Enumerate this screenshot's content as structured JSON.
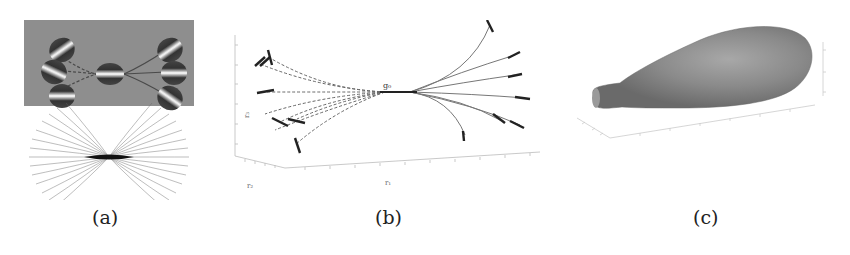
{
  "figure": {
    "panels": [
      {
        "id": "a",
        "caption": "(a)",
        "description": "Gabor patch association field: central oriented patch connected by dashed and solid curves to six flanking patches on a gray background; below, a bowtie-shaped fan of line trajectories"
      },
      {
        "id": "b",
        "caption": "(b)",
        "description": "3D plot of curved trajectories emanating from a point g0; dashed curves to the left, solid curves to the right, each ending in a short oriented bar segment",
        "labels": {
          "origin": "g₀",
          "x_axis": "r₁",
          "y_axis": "r₂",
          "z_axis": "r₃"
        }
      },
      {
        "id": "c",
        "caption": "(c)",
        "description": "3D rendered gray teardrop / pear-shaped surface on box axes"
      }
    ],
    "colors": {
      "background": "#ffffff",
      "gabor_background": "#8e8e8e",
      "curve": "#555555",
      "bar": "#222222",
      "surface": "#8a8a8a",
      "axis": "#bbbbbb"
    }
  }
}
